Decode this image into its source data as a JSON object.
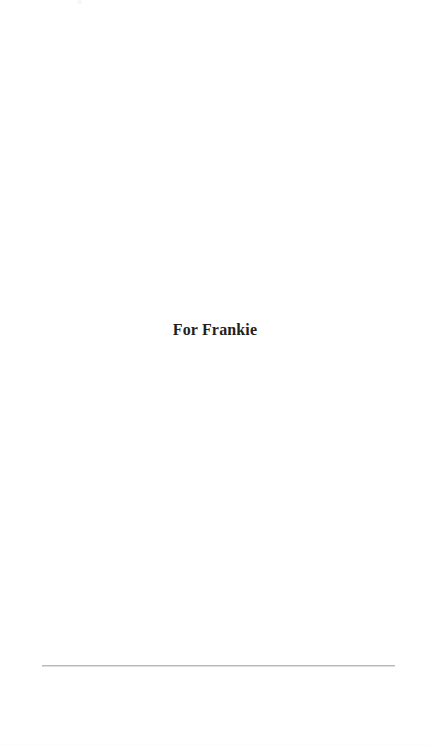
{
  "page": {
    "kind": "book-dedication-page",
    "background_color": "#ffffff",
    "width": 430,
    "height": 745
  },
  "dedication": {
    "text": "For Frankie",
    "color": "#231f20"
  },
  "rule": {
    "color": "#b9b9bb",
    "shadow_color": "#dedee0"
  },
  "artifacts": {
    "top_speck_color": "#f7f6f6",
    "paper_edge_color": "#fdfdfd"
  }
}
